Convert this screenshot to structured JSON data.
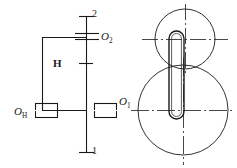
{
  "figure": {
    "background_color": "#ffffff",
    "line_color": "#1a1a1a",
    "width": 237,
    "height": 168
  },
  "labels": {
    "gear_2_axis": {
      "text": "2",
      "name": "gear-2-shaft-label"
    },
    "gear_1_axis": {
      "text": "1",
      "name": "gear-1-shaft-label"
    },
    "center_O2": {
      "base": "O",
      "subscript": "2",
      "name": "center-O2-label"
    },
    "center_O1": {
      "base": "O",
      "subscript": "1",
      "name": "center-O1-label"
    },
    "center_OH": {
      "base": "O",
      "subscript": "H",
      "name": "center-OH-label"
    },
    "carrier": {
      "text": "H",
      "name": "carrier-arm-label"
    }
  },
  "left_view": {
    "name": "kinematic-schematic-view",
    "description": "Side-view kinematic diagram with central shaft, carrier arm H and four bearing symbols",
    "central_shaft": {
      "x": 86,
      "y_top": 16,
      "y_bottom": 152
    },
    "shaft_end_caps": [
      {
        "x_left": 78,
        "x_right": 94,
        "y": 16
      },
      {
        "x_left": 78,
        "x_right": 94,
        "y": 152
      }
    ],
    "tick_marks": [
      {
        "x_left": 79,
        "x_right": 93,
        "y": 63
      }
    ],
    "carrier_arm": {
      "left_x": 42,
      "right_x": 86,
      "top_y": 37,
      "bottom_y": 110
    },
    "bearings": [
      {
        "name": "bearing-O2",
        "cx": 86,
        "cy": 36,
        "orientation": "horizontal-top"
      },
      {
        "name": "bearing-O1",
        "cx": 103,
        "cy": 110,
        "orientation": "horizontal"
      },
      {
        "name": "bearing-OH",
        "cx": 46,
        "cy": 110,
        "orientation": "horizontal"
      }
    ]
  },
  "right_view": {
    "name": "end-view-gears",
    "description": "End view showing two pitch circles and the carrier link",
    "small_circle": {
      "cx": 185,
      "cy": 39,
      "r": 30,
      "name": "gear-2-pitch-circle"
    },
    "large_circle": {
      "cx": 183,
      "cy": 110,
      "r": 45,
      "name": "gear-1-pitch-circle"
    },
    "carrier_link": {
      "name": "carrier-link-body",
      "cx": 176,
      "y_top": 31,
      "y_bottom": 118,
      "half_width": 7
    },
    "center_lines": [
      {
        "name": "small-circle-horizontal-centerline",
        "x1": 142,
        "x2": 228,
        "y": 39
      },
      {
        "name": "small-circle-vertical-centerline",
        "x": 185,
        "y1": 4,
        "y2": 75
      },
      {
        "name": "large-circle-horizontal-centerline",
        "x1": 132,
        "x2": 234,
        "y": 110
      },
      {
        "name": "large-circle-vertical-centerline",
        "x": 183,
        "y1": 60,
        "y2": 163
      }
    ]
  }
}
